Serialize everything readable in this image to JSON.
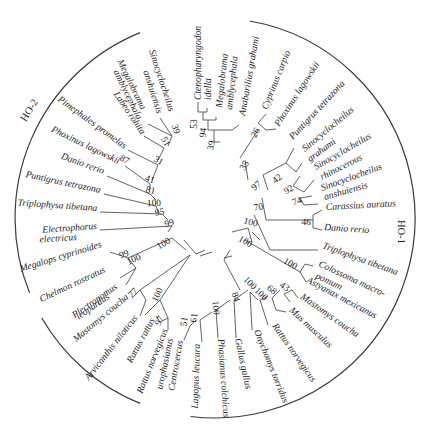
{
  "figure": {
    "type": "circular-phylogenetic-tree",
    "groups": [
      {
        "id": "HO-1",
        "label": "HO-1",
        "x": 398,
        "y": 232,
        "rotate": 90,
        "arc": {
          "cx": 215,
          "cy": 218,
          "r": 200,
          "start": -80,
          "end": 55
        }
      },
      {
        "id": "HO-2",
        "label": "HO-2",
        "x": 32,
        "y": 112,
        "rotate": -58,
        "arc": {
          "cx": 215,
          "cy": 218,
          "r": 200,
          "start": 158,
          "end": 248
        }
      }
    ],
    "extra_arcs": [
      {
        "cx": 215,
        "cy": 218,
        "r": 200,
        "start": 112,
        "end": 150
      },
      {
        "cx": 215,
        "cy": 218,
        "r": 200,
        "start": 55,
        "end": 97
      }
    ],
    "leaves": [
      {
        "label": "Ctenopharyngodon",
        "x": 201,
        "y": 100,
        "rotate": -90
      },
      {
        "label": "idella",
        "x": 211,
        "y": 100,
        "rotate": -90
      },
      {
        "label": "Megalobrama",
        "x": 222,
        "y": 108,
        "rotate": -84
      },
      {
        "label": "amblycephala",
        "x": 232,
        "y": 110,
        "rotate": -84
      },
      {
        "label": "Anabarilius grahami",
        "x": 245,
        "y": 116,
        "rotate": -80
      },
      {
        "label": "Cyprinus carpio",
        "x": 267,
        "y": 110,
        "rotate": -68
      },
      {
        "label": "Phoxinus lagowskii",
        "x": 279,
        "y": 127,
        "rotate": -57
      },
      {
        "label": "Puntigrus tetrazona",
        "x": 293,
        "y": 140,
        "rotate": -47
      },
      {
        "label": "Sinocyclocheilus",
        "x": 305,
        "y": 152,
        "rotate": -40
      },
      {
        "label": "grahami",
        "x": 310,
        "y": 162,
        "rotate": -36
      },
      {
        "label": "Sinocyclocheilus",
        "x": 316,
        "y": 170,
        "rotate": -30
      },
      {
        "label": "rhinocerous",
        "x": 322,
        "y": 180,
        "rotate": -27
      },
      {
        "label": "Sinocyclocheilus",
        "x": 322,
        "y": 191,
        "rotate": -20
      },
      {
        "label": "anshuiensis",
        "x": 325,
        "y": 200,
        "rotate": -16
      },
      {
        "label": "Carassius auratus",
        "x": 326,
        "y": 210,
        "rotate": -3
      },
      {
        "label": "Danio rerio",
        "x": 324,
        "y": 230,
        "rotate": 4
      },
      {
        "label": "Triplophysa tibetana",
        "x": 322,
        "y": 248,
        "rotate": 20
      },
      {
        "label": "Colossoma macro-",
        "x": 318,
        "y": 266,
        "rotate": 25
      },
      {
        "label": "pomum",
        "x": 315,
        "y": 278,
        "rotate": 25
      },
      {
        "label": "Astyanax mexicanus",
        "x": 306,
        "y": 282,
        "rotate": 28
      },
      {
        "label": "Mastomys coucha",
        "x": 300,
        "y": 298,
        "rotate": 35
      },
      {
        "label": "Mus musculus",
        "x": 289,
        "y": 311,
        "rotate": 43
      },
      {
        "label": "Rattus norvegicus",
        "x": 272,
        "y": 326,
        "rotate": 55
      },
      {
        "label": "Onychomys torridus",
        "x": 254,
        "y": 331,
        "rotate": 68
      },
      {
        "label": "Gallus gallus",
        "x": 235,
        "y": 339,
        "rotate": 78
      },
      {
        "label": "Phasianus colchicus",
        "x": 218,
        "y": 339,
        "rotate": 86
      },
      {
        "label": "Lagopus leucura",
        "x": 200,
        "y": 344,
        "rotate": 92
      },
      {
        "label": "Centrocercus",
        "x": 183,
        "y": 341,
        "rotate": 100
      },
      {
        "label": "urophasianus",
        "x": 173,
        "y": 339,
        "rotate": 102
      },
      {
        "label": "Rattus norvegicus",
        "x": 168,
        "y": 330,
        "rotate": 112
      },
      {
        "label": "Rattus rattus",
        "x": 155,
        "y": 320,
        "rotate": 118
      },
      {
        "label": "Arvicanthis niloticus",
        "x": 138,
        "y": 318,
        "rotate": 128
      },
      {
        "label": "Mastomys coucha",
        "x": 129,
        "y": 298,
        "rotate": 140
      },
      {
        "label": "Plectropomus",
        "x": 118,
        "y": 288,
        "rotate": 145
      },
      {
        "label": "leopardus",
        "x": 110,
        "y": 298,
        "rotate": 145
      },
      {
        "label": "Chelmon rostratus",
        "x": 106,
        "y": 272,
        "rotate": 155
      },
      {
        "label": "Megalops cyprinoides",
        "x": 102,
        "y": 247,
        "rotate": 163
      },
      {
        "label": "Electrophorus",
        "x": 97,
        "y": 229,
        "rotate": 176
      },
      {
        "label": "electricus",
        "x": 77,
        "y": 240,
        "rotate": 176
      },
      {
        "label": "Triplophysa tibetana",
        "x": 97,
        "y": 211,
        "rotate": -176
      },
      {
        "label": "Puntigrus tetrazona",
        "x": 100,
        "y": 193,
        "rotate": -168
      },
      {
        "label": "Danio rerio",
        "x": 103,
        "y": 174,
        "rotate": -160
      },
      {
        "label": "Phoxinus lagowskii",
        "x": 118,
        "y": 164,
        "rotate": -154
      },
      {
        "label": "Pimephales promelas",
        "x": 124,
        "y": 149,
        "rotate": -144
      },
      {
        "label": "Labeo rohita",
        "x": 141,
        "y": 135,
        "rotate": -124
      },
      {
        "label": "Megalobrama",
        "x": 141,
        "y": 110,
        "rotate": -116
      },
      {
        "label": "amblycephala",
        "x": 137,
        "y": 120,
        "rotate": -116
      },
      {
        "label": "Sinocyclocheilus",
        "x": 169,
        "y": 112,
        "rotate": -108
      },
      {
        "label": "anshuiensis",
        "x": 157,
        "y": 114,
        "rotate": -108
      }
    ],
    "bootstrap": [
      {
        "value": "53",
        "x": 197,
        "y": 124,
        "rotate": -90
      },
      {
        "value": "94",
        "x": 206,
        "y": 133,
        "rotate": -84
      },
      {
        "value": "39",
        "x": 214,
        "y": 146,
        "rotate": -78
      },
      {
        "value": "26",
        "x": 258,
        "y": 134,
        "rotate": -62
      },
      {
        "value": "35",
        "x": 247,
        "y": 167,
        "rotate": -60
      },
      {
        "value": "42",
        "x": 279,
        "y": 181,
        "rotate": -40
      },
      {
        "value": "92",
        "x": 290,
        "y": 192,
        "rotate": -30
      },
      {
        "value": "74",
        "x": 298,
        "y": 204,
        "rotate": -20
      },
      {
        "value": "97",
        "x": 258,
        "y": 188,
        "rotate": -38
      },
      {
        "value": "70",
        "x": 259,
        "y": 210,
        "rotate": -10
      },
      {
        "value": "46",
        "x": 306,
        "y": 225,
        "rotate": 4
      },
      {
        "value": "100",
        "x": 250,
        "y": 225,
        "rotate": 15
      },
      {
        "value": "100",
        "x": 244,
        "y": 244,
        "rotate": 30
      },
      {
        "value": "100",
        "x": 289,
        "y": 266,
        "rotate": 30
      },
      {
        "value": "100",
        "x": 248,
        "y": 285,
        "rotate": 45
      },
      {
        "value": "84",
        "x": 233,
        "y": 298,
        "rotate": 70
      },
      {
        "value": "100",
        "x": 259,
        "y": 296,
        "rotate": 45
      },
      {
        "value": "68",
        "x": 270,
        "y": 292,
        "rotate": 40
      },
      {
        "value": "43",
        "x": 283,
        "y": 289,
        "rotate": 35
      },
      {
        "value": "100",
        "x": 213,
        "y": 308,
        "rotate": 85
      },
      {
        "value": "61",
        "x": 197,
        "y": 318,
        "rotate": 95
      },
      {
        "value": "51",
        "x": 187,
        "y": 322,
        "rotate": 100
      },
      {
        "value": "100",
        "x": 160,
        "y": 296,
        "rotate": 115
      },
      {
        "value": "97",
        "x": 162,
        "y": 322,
        "rotate": 115
      },
      {
        "value": "77",
        "x": 135,
        "y": 295,
        "rotate": 135
      },
      {
        "value": "100",
        "x": 135,
        "y": 262,
        "rotate": 155
      },
      {
        "value": "99",
        "x": 125,
        "y": 257,
        "rotate": 160
      },
      {
        "value": "100",
        "x": 165,
        "y": 246,
        "rotate": 150
      },
      {
        "value": "99",
        "x": 170,
        "y": 226,
        "rotate": 165
      },
      {
        "value": "95",
        "x": 160,
        "y": 215,
        "rotate": 172
      },
      {
        "value": "100",
        "x": 154,
        "y": 206,
        "rotate": 178
      },
      {
        "value": "81",
        "x": 150,
        "y": 193,
        "rotate": -168
      },
      {
        "value": "41",
        "x": 149,
        "y": 182,
        "rotate": -162
      },
      {
        "value": "31",
        "x": 157,
        "y": 163,
        "rotate": -150
      },
      {
        "value": "87",
        "x": 123,
        "y": 162,
        "rotate": -150
      },
      {
        "value": "51",
        "x": 163,
        "y": 143,
        "rotate": -120
      },
      {
        "value": "39",
        "x": 173,
        "y": 130,
        "rotate": -110
      }
    ]
  }
}
